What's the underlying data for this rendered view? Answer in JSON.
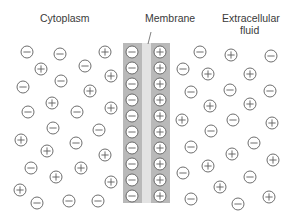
{
  "labels": {
    "cytoplasm": "Cytoplasm",
    "membrane": "Membrane",
    "extracellular_line1": "Extracellular",
    "extracellular_line2": "fluid"
  },
  "colors": {
    "background": "#ffffff",
    "membrane_band": "#b9b9b9",
    "membrane_core": "#e3e3e3",
    "ion_stroke": "#5e5e5e",
    "ion_fill": "#ffffff",
    "text": "#3a3a3a"
  },
  "membrane": {
    "top": 43,
    "bottom": 203,
    "left_band": [
      123,
      142
    ],
    "core": [
      142,
      151
    ],
    "right_band": [
      151,
      170
    ],
    "inner_ion_x": 132,
    "outer_ion_x": 160,
    "inner_charge": "-",
    "outer_charge": "+",
    "rows_y": [
      52,
      68,
      84,
      100,
      116,
      132,
      148,
      164,
      180,
      196
    ]
  },
  "cytoplasm_ions": [
    {
      "x": 27,
      "y": 52,
      "c": "-"
    },
    {
      "x": 60,
      "y": 54,
      "c": "-"
    },
    {
      "x": 105,
      "y": 52,
      "c": "+"
    },
    {
      "x": 41,
      "y": 69,
      "c": "+"
    },
    {
      "x": 85,
      "y": 66,
      "c": "-"
    },
    {
      "x": 111,
      "y": 76,
      "c": "+"
    },
    {
      "x": 23,
      "y": 87,
      "c": "-"
    },
    {
      "x": 61,
      "y": 81,
      "c": "-"
    },
    {
      "x": 90,
      "y": 91,
      "c": "+"
    },
    {
      "x": 52,
      "y": 103,
      "c": "+"
    },
    {
      "x": 28,
      "y": 112,
      "c": "-"
    },
    {
      "x": 77,
      "y": 112,
      "c": "-"
    },
    {
      "x": 111,
      "y": 108,
      "c": "+"
    },
    {
      "x": 53,
      "y": 128,
      "c": "-"
    },
    {
      "x": 99,
      "y": 130,
      "c": "-"
    },
    {
      "x": 21,
      "y": 140,
      "c": "+"
    },
    {
      "x": 76,
      "y": 143,
      "c": "-"
    },
    {
      "x": 47,
      "y": 151,
      "c": "+"
    },
    {
      "x": 105,
      "y": 155,
      "c": "+"
    },
    {
      "x": 31,
      "y": 168,
      "c": "-"
    },
    {
      "x": 81,
      "y": 168,
      "c": "+"
    },
    {
      "x": 56,
      "y": 177,
      "c": "+"
    },
    {
      "x": 111,
      "y": 182,
      "c": "+"
    },
    {
      "x": 20,
      "y": 190,
      "c": "+"
    },
    {
      "x": 37,
      "y": 203,
      "c": "-"
    },
    {
      "x": 69,
      "y": 201,
      "c": "-"
    },
    {
      "x": 98,
      "y": 201,
      "c": "-"
    }
  ],
  "extracellular_ions": [
    {
      "x": 200,
      "y": 52,
      "c": "-"
    },
    {
      "x": 231,
      "y": 55,
      "c": "+"
    },
    {
      "x": 271,
      "y": 56,
      "c": "-"
    },
    {
      "x": 183,
      "y": 69,
      "c": "-"
    },
    {
      "x": 208,
      "y": 74,
      "c": "+"
    },
    {
      "x": 250,
      "y": 74,
      "c": "+"
    },
    {
      "x": 191,
      "y": 92,
      "c": "-"
    },
    {
      "x": 230,
      "y": 90,
      "c": "-"
    },
    {
      "x": 270,
      "y": 91,
      "c": "-"
    },
    {
      "x": 210,
      "y": 106,
      "c": "+"
    },
    {
      "x": 250,
      "y": 104,
      "c": "+"
    },
    {
      "x": 182,
      "y": 120,
      "c": "+"
    },
    {
      "x": 233,
      "y": 120,
      "c": "-"
    },
    {
      "x": 272,
      "y": 123,
      "c": "+"
    },
    {
      "x": 211,
      "y": 131,
      "c": "-"
    },
    {
      "x": 191,
      "y": 147,
      "c": "-"
    },
    {
      "x": 254,
      "y": 143,
      "c": "-"
    },
    {
      "x": 232,
      "y": 154,
      "c": "+"
    },
    {
      "x": 273,
      "y": 160,
      "c": "+"
    },
    {
      "x": 208,
      "y": 166,
      "c": "+"
    },
    {
      "x": 183,
      "y": 173,
      "c": "-"
    },
    {
      "x": 250,
      "y": 177,
      "c": "-"
    },
    {
      "x": 220,
      "y": 187,
      "c": "+"
    },
    {
      "x": 191,
      "y": 199,
      "c": "-"
    },
    {
      "x": 238,
      "y": 204,
      "c": "-"
    },
    {
      "x": 269,
      "y": 197,
      "c": "+"
    }
  ]
}
